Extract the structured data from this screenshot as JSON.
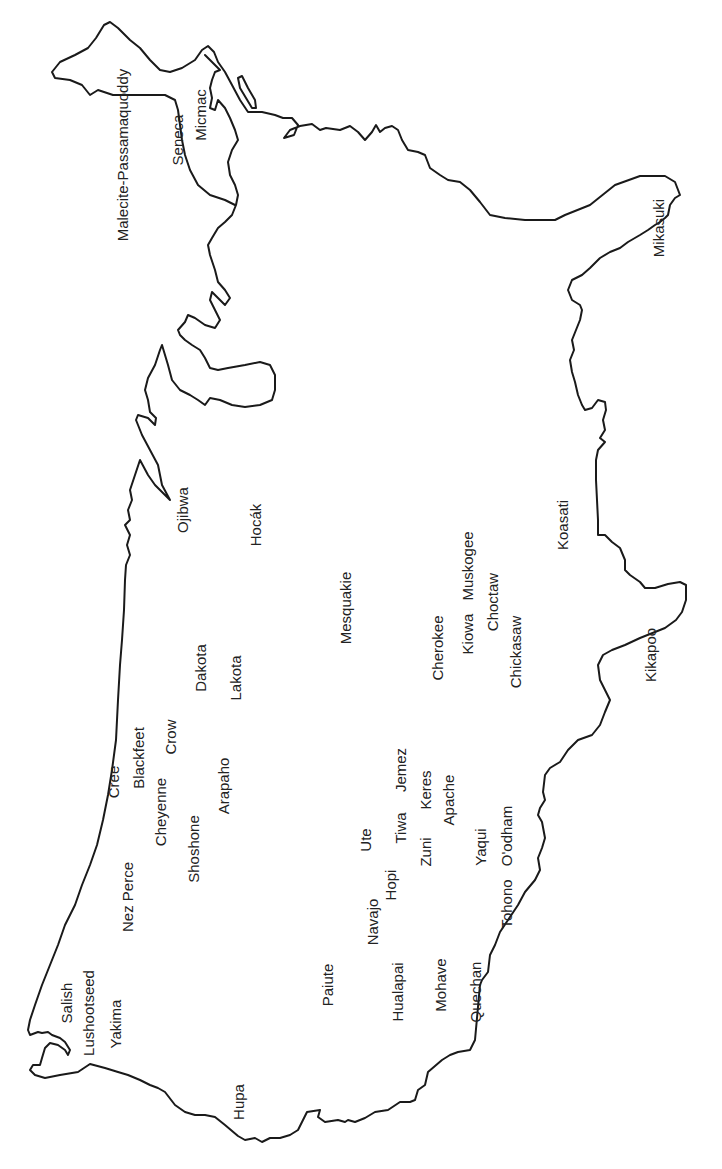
{
  "map": {
    "title": "",
    "orientation": "rotated -90deg (north at left)",
    "outline_color": "#1a1a1a",
    "label_color": "#222222",
    "labels": [
      {
        "text": "Malecite-Passamaquoddy",
        "x": 122,
        "y": 155
      },
      {
        "text": "Seneca",
        "x": 177,
        "y": 140
      },
      {
        "text": "Micmac",
        "x": 200,
        "y": 115
      },
      {
        "text": "Mikasuki",
        "x": 658,
        "y": 228
      },
      {
        "text": "Ojibwa",
        "x": 182,
        "y": 510
      },
      {
        "text": "Hocák",
        "x": 255,
        "y": 525
      },
      {
        "text": "Koasati",
        "x": 562,
        "y": 525
      },
      {
        "text": "Muskogee",
        "x": 467,
        "y": 566
      },
      {
        "text": "Choctaw",
        "x": 492,
        "y": 602
      },
      {
        "text": "Mesquakie",
        "x": 345,
        "y": 608
      },
      {
        "text": "Kiowa",
        "x": 467,
        "y": 634
      },
      {
        "text": "Cherokee",
        "x": 437,
        "y": 648
      },
      {
        "text": "Chickasaw",
        "x": 515,
        "y": 652
      },
      {
        "text": "Kikapoo",
        "x": 650,
        "y": 655
      },
      {
        "text": "Dakota",
        "x": 200,
        "y": 668
      },
      {
        "text": "Lakota",
        "x": 235,
        "y": 678
      },
      {
        "text": "Crow",
        "x": 170,
        "y": 737
      },
      {
        "text": "Blackfeet",
        "x": 138,
        "y": 758
      },
      {
        "text": "Jemez",
        "x": 400,
        "y": 770
      },
      {
        "text": "Cree",
        "x": 113,
        "y": 782
      },
      {
        "text": "Arapaho",
        "x": 223,
        "y": 786
      },
      {
        "text": "Keres",
        "x": 425,
        "y": 790
      },
      {
        "text": "Apache",
        "x": 448,
        "y": 800
      },
      {
        "text": "Cheyenne",
        "x": 160,
        "y": 812
      },
      {
        "text": "Tiwa",
        "x": 400,
        "y": 828
      },
      {
        "text": "O'odham",
        "x": 506,
        "y": 836
      },
      {
        "text": "Ute",
        "x": 365,
        "y": 840
      },
      {
        "text": "Yaqui",
        "x": 480,
        "y": 847
      },
      {
        "text": "Shoshone",
        "x": 193,
        "y": 849
      },
      {
        "text": "Zuni",
        "x": 425,
        "y": 852
      },
      {
        "text": "Hopi",
        "x": 390,
        "y": 885
      },
      {
        "text": "Nez Perce",
        "x": 127,
        "y": 897
      },
      {
        "text": "Tohono",
        "x": 506,
        "y": 904
      },
      {
        "text": "Navajo",
        "x": 372,
        "y": 922
      },
      {
        "text": "Paiute",
        "x": 327,
        "y": 985
      },
      {
        "text": "Mohave",
        "x": 440,
        "y": 985
      },
      {
        "text": "Hualapai",
        "x": 397,
        "y": 992
      },
      {
        "text": "Quechan",
        "x": 475,
        "y": 992
      },
      {
        "text": "Salish",
        "x": 66,
        "y": 1003
      },
      {
        "text": "Lushootseed",
        "x": 88,
        "y": 1013
      },
      {
        "text": "Yakima",
        "x": 115,
        "y": 1024
      },
      {
        "text": "Hupa",
        "x": 238,
        "y": 1102
      }
    ]
  }
}
